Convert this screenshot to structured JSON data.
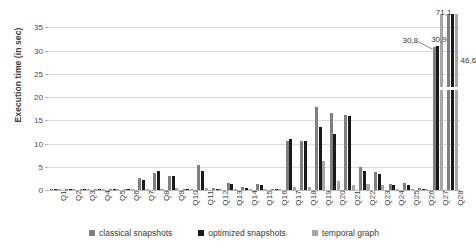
{
  "chart_data": {
    "type": "bar",
    "title": "",
    "xlabel": "",
    "ylabel": "Execution time (in sec)",
    "ylim": [
      0,
      37
    ],
    "yticks": [
      0,
      5,
      10,
      15,
      20,
      25,
      30,
      35
    ],
    "grid": true,
    "legend_position": "bottom",
    "axis_break": true,
    "categories": [
      "Q1",
      "Q2",
      "Q3",
      "Q4",
      "Q5",
      "Q6",
      "Q7",
      "Q8",
      "Q9",
      "Q10",
      "Q11",
      "Q12",
      "Q13",
      "Q14",
      "Q15",
      "Q16",
      "Q17",
      "Q18",
      "Q19",
      "Q20",
      "Q21",
      "Q22",
      "Q23",
      "Q24",
      "Q25",
      "Q26",
      "Q27",
      "Q28"
    ],
    "series": [
      {
        "name": "classical snapshots",
        "color": "#7f7f7f",
        "values": [
          0.2,
          0.2,
          0.2,
          0.2,
          0.2,
          0.3,
          2.6,
          3.6,
          3.1,
          0.1,
          5.4,
          0.4,
          1.5,
          0.6,
          1.4,
          0.3,
          10.5,
          10.5,
          17.8,
          16.6,
          16.1,
          5.0,
          3.9,
          1.2,
          1.5,
          0.4,
          30.8,
          46.6
        ]
      },
      {
        "name": "optimized snapshots",
        "color": "#1a1a1a",
        "values": [
          0.2,
          0.2,
          0.2,
          0.2,
          0.2,
          0.3,
          2.2,
          4.1,
          3.0,
          0.2,
          4.0,
          0.3,
          1.2,
          0.5,
          1.0,
          0.2,
          10.9,
          10.5,
          13.6,
          12.1,
          16.0,
          4.0,
          3.4,
          1.1,
          1.0,
          0.3,
          30.9,
          46.6
        ]
      },
      {
        "name": "temporal graph",
        "color": "#a6a6a6",
        "values": [
          0.1,
          0.1,
          0.1,
          0.1,
          0.1,
          0.1,
          0.2,
          0.3,
          0.4,
          0.1,
          0.4,
          0.2,
          0.2,
          0.1,
          0.2,
          0.1,
          0.6,
          0.7,
          6.3,
          1.9,
          1.0,
          1.3,
          1.1,
          0.2,
          0.2,
          0.1,
          71.1,
          46.6
        ]
      }
    ],
    "data_labels": [
      {
        "text": "30,8",
        "series": "classical snapshots",
        "category": "Q27",
        "value": 30.8
      },
      {
        "text": "30,9",
        "series": "optimized snapshots",
        "category": "Q27",
        "value": 30.9
      },
      {
        "text": "71,1",
        "series": "temporal graph",
        "category": "Q27",
        "value": 71.1
      },
      {
        "text": "46,6",
        "series": "temporal graph",
        "category": "Q28",
        "value": 46.6
      }
    ]
  },
  "legend": {
    "items": [
      {
        "label": "classical snapshots"
      },
      {
        "label": "optimized snapshots"
      },
      {
        "label": "temporal graph"
      }
    ]
  }
}
